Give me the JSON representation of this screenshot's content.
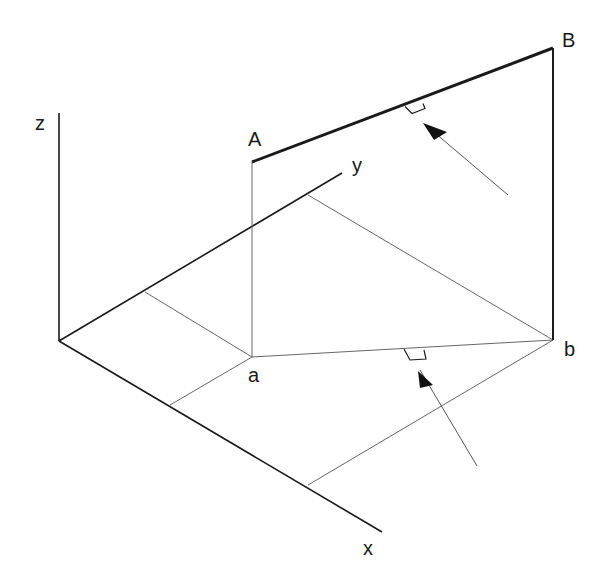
{
  "diagram": {
    "type": "isometric-projection",
    "axes": {
      "x": {
        "label": "x"
      },
      "y": {
        "label": "y"
      },
      "z": {
        "label": "z"
      }
    },
    "points": {
      "A": {
        "label": "A"
      },
      "B": {
        "label": "B"
      },
      "a": {
        "label": "a"
      },
      "b": {
        "label": "b"
      }
    },
    "segments": [
      {
        "from": "A",
        "to": "B",
        "style": "thick",
        "description": "line AB in space"
      },
      {
        "from": "a",
        "to": "b",
        "style": "thin",
        "description": "projection ab on xy-plane"
      },
      {
        "from": "A",
        "to": "a",
        "style": "thin",
        "description": "projector from A"
      },
      {
        "from": "B",
        "to": "b",
        "style": "thick",
        "description": "projector from B"
      }
    ],
    "annotations": [
      {
        "type": "right-angle-with-arrow",
        "target": "AB",
        "description": "viewing direction perpendicular to AB"
      },
      {
        "type": "right-angle-with-arrow",
        "target": "ab",
        "description": "viewing direction perpendicular to ab"
      }
    ],
    "colors": {
      "line": "#1a1a1a",
      "thin_line": "#555555",
      "background": "#ffffff"
    }
  }
}
